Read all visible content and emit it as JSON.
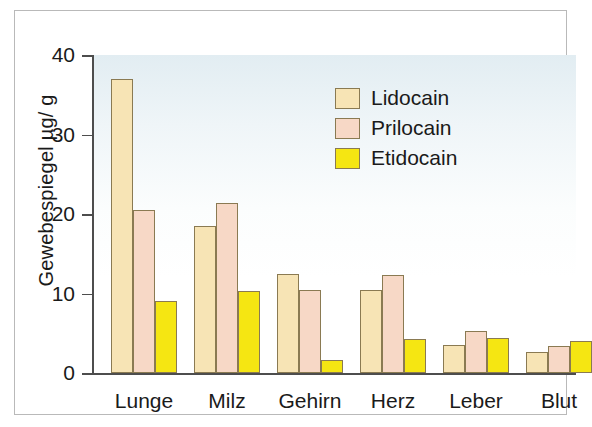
{
  "chart_data": {
    "type": "bar",
    "title": "",
    "xlabel": "",
    "ylabel": "Gewebespiegel µg/ g",
    "categories": [
      "Lunge",
      "Milz",
      "Gehirn",
      "Herz",
      "Leber",
      "Blut"
    ],
    "series": [
      {
        "name": "Lidocain",
        "color": "#f7e4b5",
        "values": [
          37.0,
          18.5,
          12.5,
          10.5,
          3.5,
          2.6
        ]
      },
      {
        "name": "Prilocain",
        "color": "#f7d8c6",
        "values": [
          20.5,
          21.4,
          10.4,
          12.3,
          5.3,
          3.4
        ]
      },
      {
        "name": "Etidocain",
        "color": "#f5e612",
        "values": [
          9.0,
          10.3,
          1.6,
          4.3,
          4.4,
          4.0
        ]
      }
    ],
    "ylim": [
      0,
      40
    ],
    "yticks": [
      0,
      10,
      20,
      30,
      40
    ],
    "ytick_labels": [
      "0",
      "10",
      "20",
      "30",
      "40"
    ],
    "grid": false,
    "legend_position": "upper right",
    "bar_outline_color": "#8a7a52",
    "axis_color": "#4d4d4d",
    "plot_background": "light-blue-to-white-vertical-gradient",
    "frame_color": "#b9b9b9"
  },
  "legend": {
    "entries": [
      {
        "label": "Lidocain"
      },
      {
        "label": "Prilocain"
      },
      {
        "label": "Etidocain"
      }
    ]
  }
}
